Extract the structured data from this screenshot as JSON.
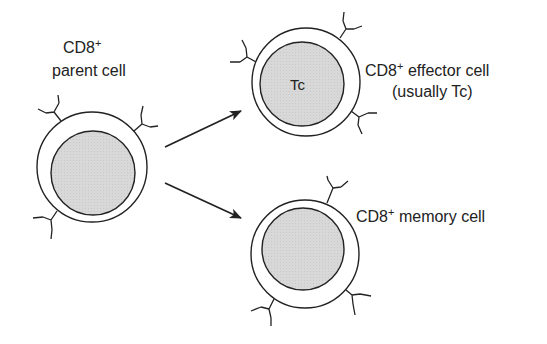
{
  "diagram": {
    "type": "cell-differentiation",
    "colors": {
      "background": "#ffffff",
      "stroke": "#222222",
      "nucleus_fill": "#d9d9d9",
      "membrane_fill": "#ffffff"
    },
    "parent_cell": {
      "label_line1": "CD8",
      "label_line1_sup": "+",
      "label_line2": "parent cell"
    },
    "effector_cell": {
      "inner_label": "Tc",
      "label_line1": "CD8",
      "label_line1_sup": "+",
      "label_line1_rest": " effector cell",
      "label_line2": "(usually Tc)"
    },
    "memory_cell": {
      "label": "CD8",
      "label_sup": "+",
      "label_rest": " memory cell"
    },
    "arrows": [
      {
        "from": "parent_cell",
        "to": "effector_cell"
      },
      {
        "from": "parent_cell",
        "to": "memory_cell"
      }
    ]
  }
}
